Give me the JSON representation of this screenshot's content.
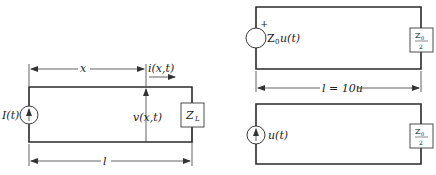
{
  "figure_left": {
    "source_label": "I(t)",
    "dimension_x_label": "x",
    "current_label": "i(x,t)",
    "voltage_label": "v(x,t)",
    "load_label_main": "Z",
    "load_label_sub": "L",
    "length_label": "l"
  },
  "figure_right_top": {
    "source_polarity": "+",
    "source_label_main": "Z",
    "source_label_sub": "0",
    "source_label_rest": "u(t)",
    "load_num_main": "Z",
    "load_num_sub": "0",
    "load_den": "2",
    "length_label": "l = 10u"
  },
  "figure_right_bottom": {
    "source_label": "u(t)",
    "load_num_main": "Z",
    "load_num_sub": "0",
    "load_den": "2"
  }
}
